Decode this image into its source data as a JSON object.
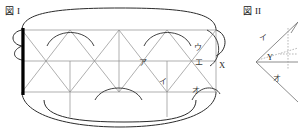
{
  "page": {
    "background": "#ffffff",
    "width": 298,
    "height": 133,
    "ink_color": "#2b2b2b",
    "thin_line_color": "#8d8d8d",
    "thick_edge_color": "#000000"
  },
  "figures": [
    {
      "id": "figure-1",
      "title_prefix": "図",
      "title_numeral": "I",
      "title_full": "図 I",
      "description": "triangular-strip-net",
      "labels": [
        {
          "name": "label-a",
          "text": "ア",
          "x": 139,
          "y": 65
        },
        {
          "name": "label-i",
          "text": "イ",
          "x": 159,
          "y": 84
        },
        {
          "name": "label-u",
          "text": "ウ",
          "x": 194,
          "y": 50
        },
        {
          "name": "label-e",
          "text": "エ",
          "x": 195,
          "y": 65
        },
        {
          "name": "label-o",
          "text": "オ",
          "x": 192,
          "y": 93
        },
        {
          "name": "label-x",
          "text": "X",
          "x": 219,
          "y": 68
        }
      ]
    },
    {
      "id": "figure-2",
      "title_prefix": "図",
      "title_numeral": "II",
      "title_full": "図 II",
      "description": "folded-cone-detail",
      "labels": [
        {
          "name": "label-i",
          "text": "イ",
          "x": 262,
          "y": 38
        },
        {
          "name": "label-y",
          "text": "Y",
          "x": 270,
          "y": 58
        },
        {
          "name": "label-o",
          "text": "オ",
          "x": 276,
          "y": 79
        }
      ]
    }
  ]
}
